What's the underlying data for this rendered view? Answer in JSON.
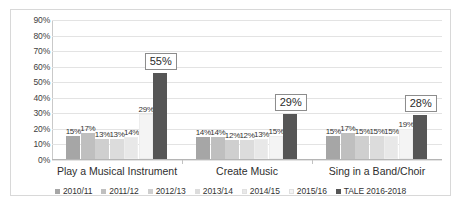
{
  "chart_data": {
    "type": "bar",
    "title": "",
    "subtitle": "",
    "xlabel": "",
    "ylabel": "",
    "ylim": [
      0,
      90
    ],
    "ytick_labels": [
      "0%",
      "10%",
      "20%",
      "30%",
      "40%",
      "50%",
      "60%",
      "70%",
      "80%",
      "90%"
    ],
    "ytick_values": [
      0,
      10,
      20,
      30,
      40,
      50,
      60,
      70,
      80,
      90
    ],
    "grid": true,
    "legend_position": "bottom",
    "categories": [
      "Play a Musical Instrument",
      "Create Music",
      "Sing in a Band/Choir"
    ],
    "series": [
      {
        "name": "2010/11",
        "color": "#a6a6a6",
        "values": [
          15,
          14,
          15
        ],
        "labels": [
          "15%",
          "14%",
          "15%"
        ]
      },
      {
        "name": "2011/12",
        "color": "#bfbfbf",
        "values": [
          17,
          14,
          17
        ],
        "labels": [
          "17%",
          "14%",
          "17%"
        ]
      },
      {
        "name": "2012/13",
        "color": "#cfcfcf",
        "values": [
          13,
          12,
          15
        ],
        "labels": [
          "13%",
          "12%",
          "15%"
        ]
      },
      {
        "name": "2013/14",
        "color": "#dcdcdc",
        "values": [
          13,
          12,
          15
        ],
        "labels": [
          "13%",
          "12%",
          "15%"
        ]
      },
      {
        "name": "2014/15",
        "color": "#e8e8e8",
        "values": [
          14,
          13,
          15
        ],
        "labels": [
          "14%",
          "13%",
          "15%"
        ]
      },
      {
        "name": "2015/16",
        "color": "#f4f4f4",
        "values": [
          29,
          15,
          19
        ],
        "labels": [
          "29%",
          "15%",
          "19%"
        ]
      },
      {
        "name": "TALE 2016-2018",
        "color": "#565656",
        "values": [
          55,
          29,
          28
        ],
        "labels": [
          "55%",
          "29%",
          "28%"
        ]
      }
    ],
    "highlight_series": "TALE 2016-2018",
    "highlight_labels": [
      "55%",
      "29%",
      "28%"
    ]
  },
  "colors": {
    "frame_border": "#d8d8d8",
    "gridline": "#e3e3e3",
    "axis": "#b5b5b5",
    "text": "#333333",
    "callout_border": "#8c8c8c",
    "plot_background": "#ffffff"
  }
}
